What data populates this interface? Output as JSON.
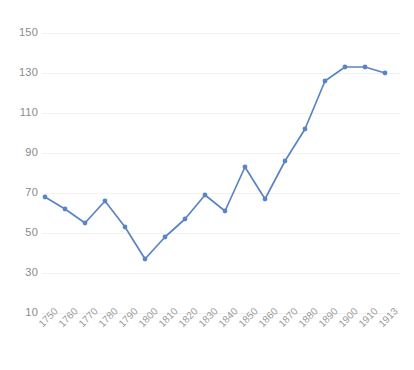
{
  "chart_data": {
    "type": "line",
    "title": "",
    "subtitle": "",
    "xlabel": "",
    "ylabel": "",
    "categories": [
      "1750",
      "1760",
      "1770",
      "1780",
      "1790",
      "1800",
      "1810",
      "1820",
      "1830",
      "1840",
      "1850",
      "1860",
      "1870",
      "1880",
      "1890",
      "1900",
      "1910",
      "1913"
    ],
    "series": [
      {
        "name": "series-1",
        "color": "#5b84c4",
        "values": [
          68,
          62,
          55,
          66,
          53,
          37,
          48,
          57,
          69,
          61,
          83,
          67,
          86,
          102,
          126,
          133,
          133,
          130
        ]
      }
    ],
    "ylim": [
      10,
      150
    ],
    "y_ticks": [
      150,
      130,
      110,
      90,
      70,
      50,
      30,
      10
    ],
    "x_ticks": [
      "1750",
      "1760",
      "1770",
      "1780",
      "1790",
      "1800",
      "1810",
      "1820",
      "1830",
      "1840",
      "1850",
      "1860",
      "1870",
      "1880",
      "1890",
      "1900",
      "1910",
      "1913"
    ],
    "grid": true,
    "gridline_color": "#f2f2f2",
    "legend": false,
    "legend_position": "none",
    "markers": true,
    "annotations": []
  },
  "style": {
    "background": "#ffffff",
    "accent": "#5b84c4",
    "tick_label_color": "#8a8a8a",
    "x_label_color": "#9b9b9b"
  }
}
